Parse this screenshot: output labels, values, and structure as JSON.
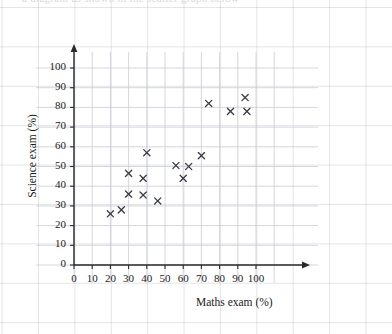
{
  "page": {
    "top_cutoff_text": "a diagram as shown in the scatter graph below"
  },
  "chart_data": {
    "type": "scatter",
    "title": "",
    "xlabel": "Maths exam (%)",
    "ylabel": "Science exam (%)",
    "xlim": [
      0,
      110
    ],
    "ylim": [
      0,
      110
    ],
    "xticks": [
      0,
      10,
      20,
      30,
      40,
      50,
      60,
      70,
      80,
      90,
      100
    ],
    "yticks": [
      0,
      10,
      20,
      30,
      40,
      50,
      60,
      70,
      80,
      90,
      100
    ],
    "xtick_labels": [
      "0",
      "10",
      "20",
      "30",
      "40",
      "50",
      "60",
      "70",
      "80",
      "90",
      "100"
    ],
    "ytick_labels": [
      "0",
      "10",
      "20",
      "30",
      "40",
      "50",
      "60",
      "70",
      "80",
      "90",
      "100"
    ],
    "grid": true,
    "legend": null,
    "marker": "x",
    "marker_color": "#3a3a44",
    "axis_color": "#2a2a2a",
    "grid_color": "#c9ccd6",
    "points": [
      {
        "x": 20,
        "y": 26
      },
      {
        "x": 26,
        "y": 28
      },
      {
        "x": 30,
        "y": 36
      },
      {
        "x": 30,
        "y": 46.5
      },
      {
        "x": 38,
        "y": 35.5
      },
      {
        "x": 38,
        "y": 44
      },
      {
        "x": 40,
        "y": 57
      },
      {
        "x": 46,
        "y": 32.5
      },
      {
        "x": 56,
        "y": 50.5
      },
      {
        "x": 60,
        "y": 44
      },
      {
        "x": 63,
        "y": 50
      },
      {
        "x": 70,
        "y": 55.5
      },
      {
        "x": 74,
        "y": 82
      },
      {
        "x": 86,
        "y": 78
      },
      {
        "x": 94,
        "y": 85
      },
      {
        "x": 95,
        "y": 78
      }
    ]
  }
}
